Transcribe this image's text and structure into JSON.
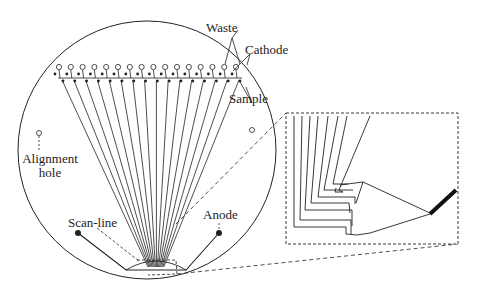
{
  "figure": {
    "labels": {
      "waste": "Waste",
      "cathode": "Cathode",
      "sample": "Sample",
      "alignment_hole_line1": "Alignment",
      "alignment_hole_line2": "hole",
      "anode": "Anode",
      "scan_line": "Scan-line"
    },
    "channel_count": 16,
    "colors": {
      "stroke": "#222222",
      "background": "#ffffff"
    }
  }
}
